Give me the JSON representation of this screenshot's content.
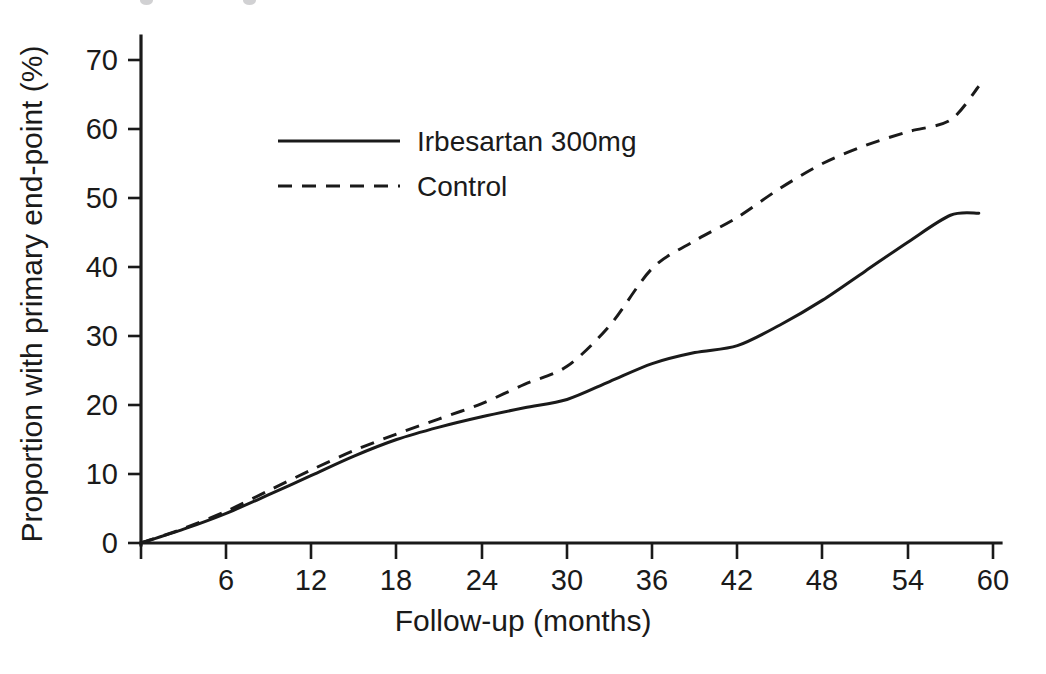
{
  "figure": {
    "background": "#ffffff",
    "ink_color": "#1a1a1a"
  },
  "axes": {
    "x_title": "Follow-up (months)",
    "y_title": "Proportion with primary end-point (%)",
    "x_ticks": [
      "0",
      "6",
      "12",
      "18",
      "24",
      "30",
      "36",
      "42",
      "48",
      "54",
      "60"
    ],
    "y_ticks": [
      "0",
      "10",
      "20",
      "30",
      "40",
      "50",
      "60",
      "70"
    ]
  },
  "legend": {
    "entries": [
      {
        "label": "Irbesartan 300mg",
        "style": "solid"
      },
      {
        "label": "Control",
        "style": "dashed"
      }
    ]
  },
  "chart_data": {
    "type": "line",
    "title": "",
    "subtitle": "",
    "xlabel": "Follow-up (months)",
    "ylabel": "Proportion with primary end-point (%)",
    "xlim": [
      0,
      60
    ],
    "ylim": [
      0,
      73
    ],
    "xticks": [
      0,
      6,
      12,
      18,
      24,
      30,
      36,
      42,
      48,
      54,
      60
    ],
    "yticks": [
      0,
      10,
      20,
      30,
      40,
      50,
      60,
      70
    ],
    "grid": false,
    "legend_position": "upper-left-inset",
    "x": [
      0,
      3,
      6,
      9,
      12,
      15,
      18,
      21,
      24,
      27,
      30,
      33,
      36,
      39,
      42,
      45,
      48,
      51,
      54,
      57,
      59
    ],
    "series": [
      {
        "name": "Irbesartan 300mg",
        "style": "solid",
        "color": "#1a1a1a",
        "values": [
          0.0,
          2.0,
          4.3,
          7.0,
          9.8,
          12.6,
          15.0,
          16.8,
          18.3,
          19.6,
          20.8,
          23.4,
          26.0,
          27.6,
          28.6,
          31.6,
          35.2,
          39.4,
          43.6,
          47.5,
          47.8
        ]
      },
      {
        "name": "Control",
        "style": "dashed",
        "color": "#1a1a1a",
        "values": [
          0.0,
          2.1,
          4.6,
          7.6,
          10.6,
          13.4,
          15.8,
          18.0,
          20.2,
          23.0,
          25.6,
          31.5,
          39.8,
          43.8,
          47.2,
          51.4,
          55.0,
          57.6,
          59.6,
          61.3,
          66.2
        ]
      }
    ],
    "annotations": []
  }
}
